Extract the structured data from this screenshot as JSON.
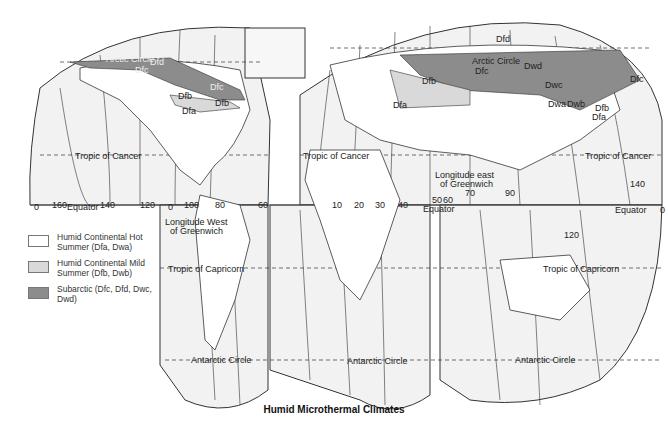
{
  "map": {
    "title": "Humid Microthermal Climates",
    "legend": [
      {
        "label": "Humid Continental Hot Summer (Dfa, Dwa)",
        "color": "#ffffff"
      },
      {
        "label": "Humid Continental Mild Summer (Dfb, Dwb)",
        "color": "#d9d9d9"
      },
      {
        "label": "Subarctic (Dfc, Dfd, Dwc, Dwd)",
        "color": "#8c8c8c"
      }
    ],
    "colors": {
      "ocean": "#f2f2f2",
      "land": "#ffffff",
      "mild": "#d9d9d9",
      "subarctic": "#8c8c8c",
      "line": "#333333"
    },
    "parallels": {
      "arctic_circle": "Arctic Circle",
      "tropic_cancer": "Tropic of Cancer",
      "equator": "Equator",
      "tropic_capricorn": "Tropic of Capricorn",
      "antarctic_circle": "Antarctic Circle"
    },
    "longitude_labels": {
      "west_title": "Longitude West of Greenwich",
      "east_title": "Longitude east of Greenwich",
      "west": [
        "0",
        "160",
        "140",
        "120",
        "0",
        "100",
        "80",
        "60"
      ],
      "east": [
        "10",
        "20",
        "30",
        "40",
        "50",
        "60",
        "70",
        "90",
        "120",
        "140",
        "0"
      ]
    },
    "region_labels": {
      "na_dfc_1": "Dfc",
      "na_dfd": "Dfd",
      "na_dfc_2": "Dfc",
      "na_dfb_1": "Dfb",
      "na_dfb_2": "Dfb",
      "na_dfa": "Dfa",
      "eu_dfb": "Dfb",
      "eu_dfa": "Dfa",
      "as_dfd": "Dfd",
      "as_dfc": "Dfc",
      "as_dwd": "Dwd",
      "as_dwc": "Dwc",
      "as_dwa": "Dwa",
      "as_dwb": "Dwb",
      "as_dfb": "Dfb",
      "as_dfa": "Dfa",
      "as_dfc_e": "Dfc"
    }
  }
}
